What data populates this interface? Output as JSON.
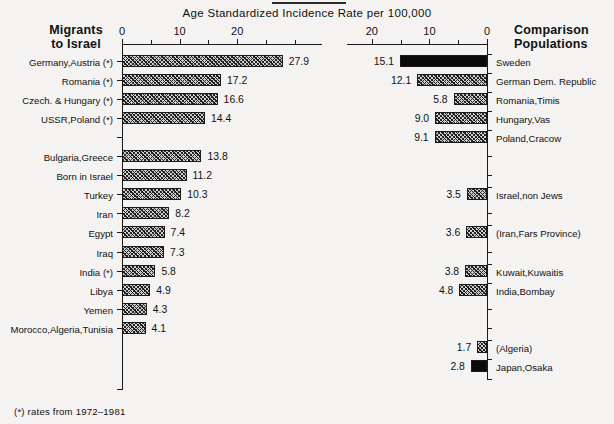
{
  "figure": {
    "axis_title": "Age Standardized Incidence Rate per 100,000",
    "left_heading_line1": "Migrants",
    "left_heading_line2": "to Israel",
    "right_heading_line1": "Comparison",
    "right_heading_line2": "Populations",
    "footnote": "(*) rates from 1972–1981"
  },
  "chart_data": {
    "type": "bar",
    "title": "Age Standardized Incidence Rate per 100,000",
    "xlabel": "Age Standardized Incidence Rate per 100,000",
    "ylabel": "",
    "orientation": "horizontal",
    "grid": false,
    "legend": "none",
    "panels": [
      {
        "name": "Migrants to Israel",
        "heading": [
          "Migrants",
          "to Israel"
        ],
        "direction": "left-to-right",
        "axis_origin_side": "left",
        "xlim": [
          0,
          35
        ],
        "tick_labels": [
          "0",
          "10",
          "20"
        ],
        "tick_values": [
          0,
          10,
          20
        ],
        "minor_tick_values": [
          5,
          15,
          25,
          30,
          35
        ],
        "categories": [
          "Germany,Austria (*)",
          "Romania (*)",
          "Czech. & Hungary (*)",
          "USSR,Poland (*)",
          "",
          "Bulgaria,Greece",
          "Born in Israel",
          "Turkey",
          "Iran",
          "Egypt",
          "Iraq",
          "India (*)",
          "Libya",
          "Yemen",
          "Morocco,Algeria,Tunisia"
        ],
        "values": [
          27.9,
          17.2,
          16.6,
          14.4,
          null,
          13.8,
          11.2,
          10.3,
          8.2,
          7.4,
          7.3,
          5.8,
          4.9,
          4.3,
          4.1
        ],
        "value_labels": [
          "27.9",
          "17.2",
          "16.6",
          "14.4",
          "",
          "13.8",
          "11.2",
          "10.3",
          "8.2",
          "7.4",
          "7.3",
          "5.8",
          "4.9",
          "4.3",
          "4.1"
        ],
        "fills": [
          "hatch",
          "hatch",
          "hatch",
          "hatch",
          null,
          "hatch",
          "hatch",
          "hatch",
          "hatch",
          "hatch",
          "hatch",
          "hatch",
          "hatch",
          "hatch",
          "hatch"
        ]
      },
      {
        "name": "Comparison Populations",
        "heading": [
          "Comparison",
          "Populations"
        ],
        "direction": "right-to-left",
        "axis_origin_side": "right",
        "xlim": [
          0,
          25
        ],
        "tick_labels": [
          "20",
          "10",
          "0"
        ],
        "tick_values": [
          20,
          10,
          0
        ],
        "minor_tick_values": [
          25,
          15,
          5
        ],
        "categories": [
          "Sweden",
          "German Dem. Republic",
          "Romania,Timis",
          "Hungary,Vas",
          "Poland,Cracow",
          "",
          "",
          "Israel,non Jews",
          "",
          "(Iran,Fars Province)",
          "",
          "Kuwait,Kuwaitis",
          "India,Bombay",
          "",
          "",
          "(Algeria)",
          "Japan,Osaka"
        ],
        "values": [
          15.1,
          12.1,
          5.8,
          9.0,
          9.1,
          null,
          null,
          3.5,
          null,
          3.6,
          null,
          3.8,
          4.8,
          null,
          null,
          1.7,
          2.8
        ],
        "value_labels": [
          "15.1",
          "12.1",
          "5.8",
          "9.0",
          "9.1",
          "",
          "",
          "3.5",
          "",
          "3.6",
          "",
          "3.8",
          "4.8",
          "",
          "",
          "1.7",
          "2.8"
        ],
        "fills": [
          "solid",
          "hatch",
          "hatch",
          "hatch",
          "hatch",
          null,
          null,
          "hatch",
          null,
          "hatch",
          null,
          "hatch",
          "hatch",
          null,
          null,
          "hatch",
          "solid"
        ]
      }
    ]
  },
  "colors": {
    "background": "#f4f3f1",
    "ink": "#111111",
    "bar_solid": "#0b0b0b",
    "bar_hatch_base": "#cfcfcf",
    "bar_hatch_line": "#1d1d1d"
  }
}
